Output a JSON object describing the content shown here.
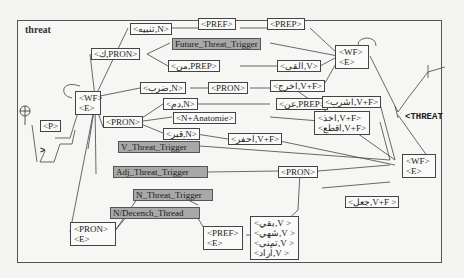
{
  "graph": {
    "title": "threat",
    "output_label": "<THREAT",
    "arrow_mark": ">",
    "nodes": {
      "wf_start": [
        "<WF>",
        "<E>"
      ],
      "p": "<P>",
      "pron_top": "<ك,PRON>",
      "n_top": "<تنبيه,N>",
      "pref_1": "<PREF>",
      "pref_2": "<PREP>",
      "future_trigger": "Future_Threat_Trigger",
      "prep_min": "<من,PREP>",
      "v_alqa": "<القى,V>",
      "wf_mid": [
        "<WF>",
        "<E>"
      ],
      "n_darb": "<ضرب,N>",
      "pron_mid": "<PRON>",
      "v_xarj": "<اخرج,V+F>",
      "pron_main": "<PRON>",
      "n_dam": "<دم,N>",
      "prep_an": "<عن,PREP>",
      "v_sharb": "<اشرب,V+F>",
      "n_anatomie": "<N+Anatomie>",
      "v_akhaz": "<اخذ,V+F>",
      "v_qata": "<اقطع,V+F>",
      "n_qabr": "<قبر,N>",
      "v_hafr": "<احفر,V+F>",
      "v_trigger": "V_Threat_Trigger",
      "adj_trigger": "Adj_Threat_Trigger",
      "pron_right": "<PRON>",
      "v_jaal": "<جعل,V+F >",
      "wf_end": [
        "<WF>",
        "<E>"
      ],
      "n_trigger": "N_Threat_Trigger",
      "n_decench": "N/Decench_Thread",
      "pron_e": [
        "<PRON>",
        "<E>"
      ],
      "pref_e": [
        "<PREF>",
        "<E>"
      ],
      "v_list": [
        "<بقي,V >",
        "<شهي,V >",
        "<تمنى,V >",
        "<أراد,V >"
      ]
    }
  }
}
